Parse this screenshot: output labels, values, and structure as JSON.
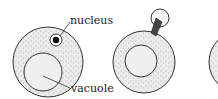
{
  "diagram": {
    "type": "cell division / budding sequence",
    "stages": [
      {
        "id": "cell-1",
        "description": "cell with nucleus and vacuole"
      },
      {
        "id": "cell-2",
        "description": "cell with nucleus forming a bud"
      },
      {
        "id": "cell-3",
        "description": "partially visible cell"
      }
    ],
    "labels": {
      "nucleus": "nucleus",
      "vacuole": "vacuole"
    },
    "colors": {
      "cytoplasm": "#e6e6e6",
      "vacuole": "#eeeeee",
      "outline": "#333333",
      "nucleus": "#111111"
    }
  }
}
